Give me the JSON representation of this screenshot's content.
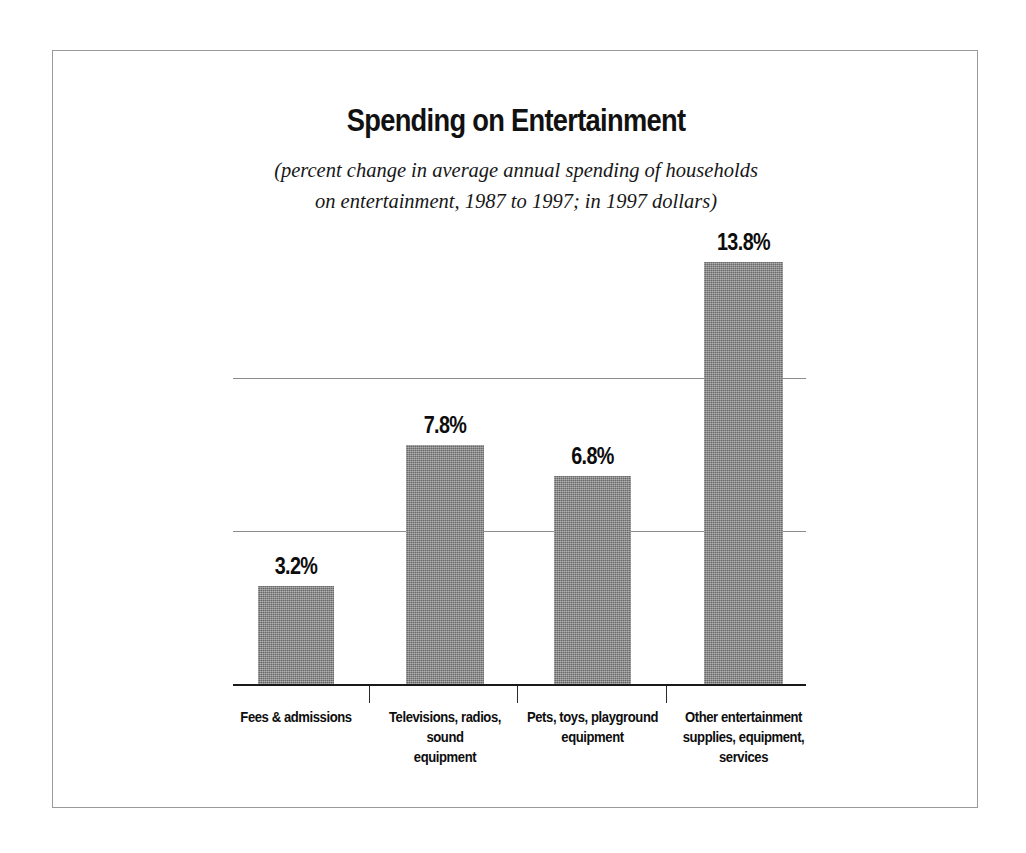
{
  "chart_data": {
    "type": "bar",
    "title": "Spending on Entertainment",
    "subtitle_line1": "(percent change in average annual spending of households",
    "subtitle_line2": "on entertainment, 1987 to 1997; in 1997 dollars)",
    "xlabel": "",
    "ylabel": "",
    "ylim": [
      0,
      15
    ],
    "gridlines": [
      5,
      10
    ],
    "grid": true,
    "legend": "none",
    "bar_color": "#8d8d8d",
    "categories": [
      "Fees & admissions",
      "Televisions, radios, sound equipment",
      "Pets, toys, playground equipment",
      "Other entertainment supplies, equipment, services"
    ],
    "category_label_lines": [
      [
        "Fees & admissions"
      ],
      [
        "Televisions, radios, sound",
        "equipment"
      ],
      [
        "Pets, toys, playground",
        "equipment"
      ],
      [
        "Other entertainment",
        "supplies, equipment,",
        "services"
      ]
    ],
    "values": [
      3.2,
      7.8,
      6.8,
      13.8
    ],
    "value_labels": [
      "3.2%",
      "7.8%",
      "6.8%",
      "13.8%"
    ]
  }
}
